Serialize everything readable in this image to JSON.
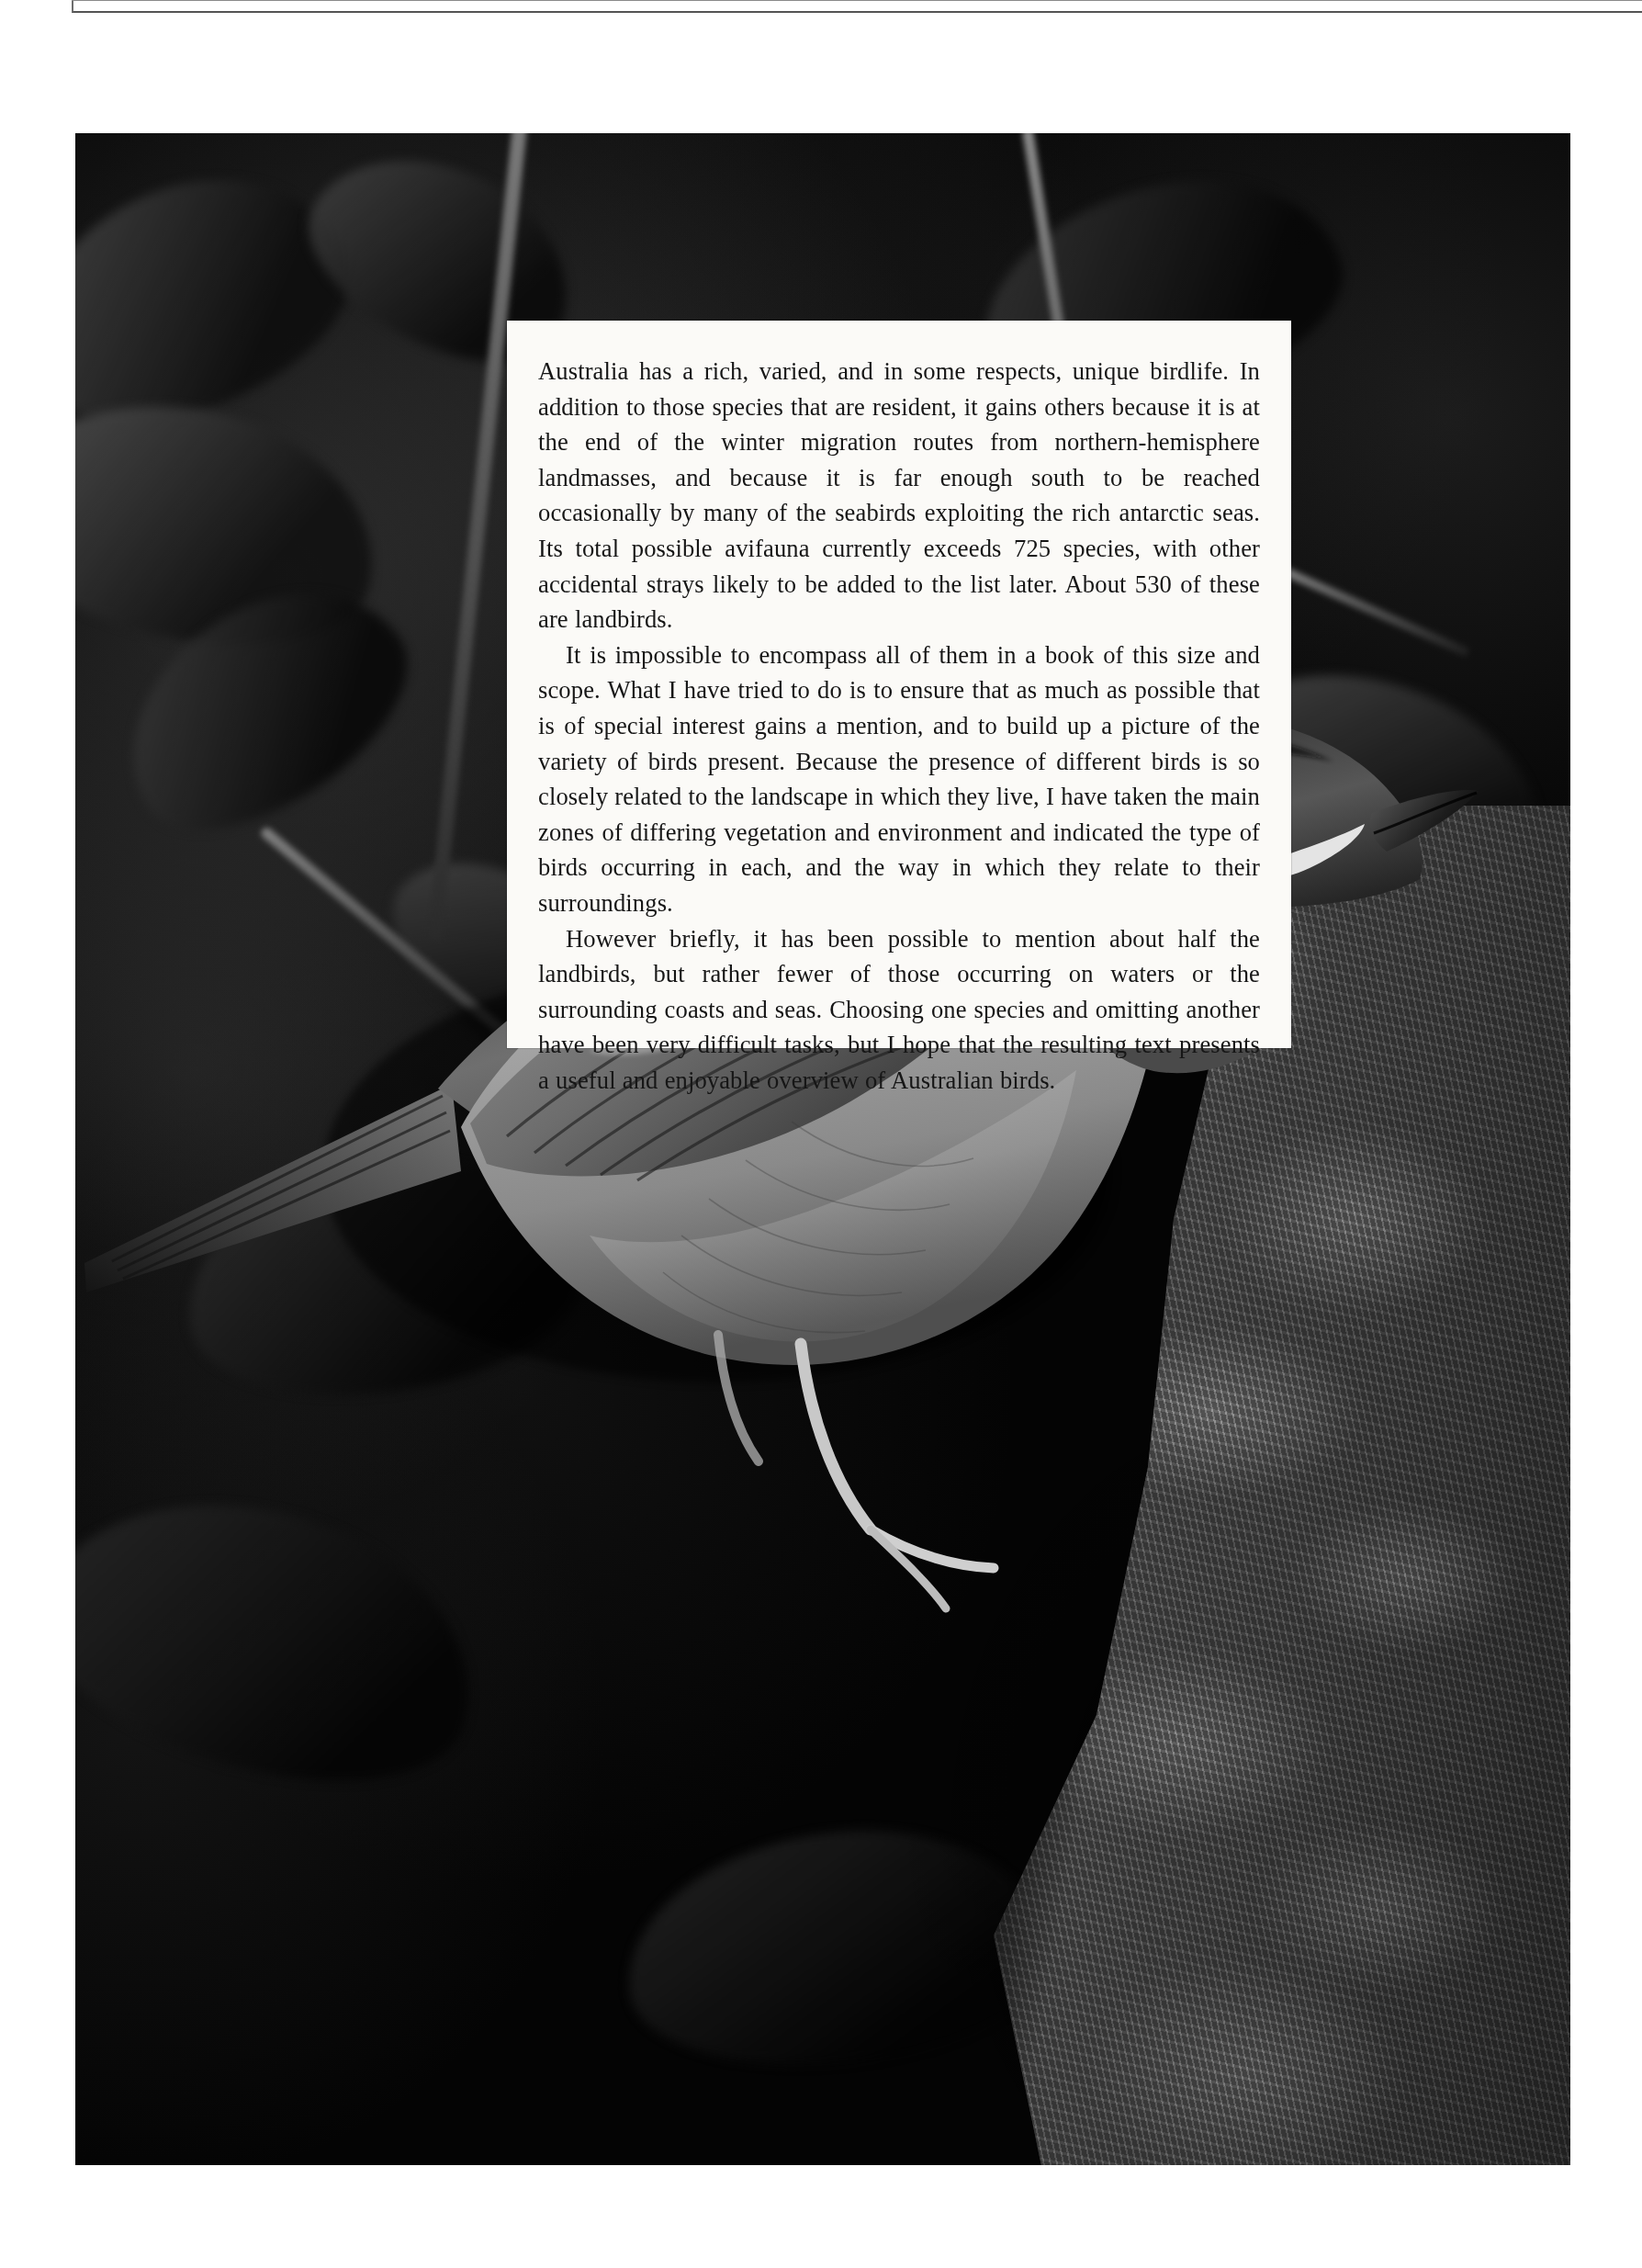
{
  "page": {
    "type": "book-page",
    "background_color": "#ffffff",
    "width": 1788,
    "height": 2469
  },
  "photo": {
    "caption_none": "",
    "subject": "honeyeater bird perched on a mossy tree trunk",
    "palette": {
      "darkest": "#040404",
      "midtone": "#6e6e6e",
      "highlight": "#e8e8e8"
    }
  },
  "text_panel": {
    "background_color": "#fbfaf7",
    "text_color": "#161616",
    "paragraphs": [
      "Australia has a rich, varied, and in some respects, unique birdlife. In addition to those species that are resident, it gains others because it is at the end of the winter migration routes from northern-hemisphere landmasses, and because it is far enough south to be reached occasionally by many of the seabirds exploiting the rich antarctic seas. Its total possible avifauna currently exceeds 725 species, with other accidental strays likely to be added to the list later. About 530 of these are landbirds.",
      "It is impossible to encompass all of them in a book of this size and scope. What I have tried to do is to ensure that as much as possible that is of special interest gains a mention, and to build up a picture of the variety of birds present. Because the presence of different birds is so closely related to the landscape in which they live, I have taken the main zones of differing vegetation and environment and indicated the type of birds occurring in each, and the way in which they relate to their surroundings.",
      "However briefly, it has been possible to mention about half the landbirds, but rather fewer of those occurring on waters or the surrounding coasts and seas. Choosing one species and omitting another have been very difficult tasks, but I hope that the resulting text presents a useful and enjoyable overview of Australian birds."
    ],
    "numbers_mentioned": {
      "total_species_exceeds": 725,
      "landbirds_about": 530
    }
  }
}
